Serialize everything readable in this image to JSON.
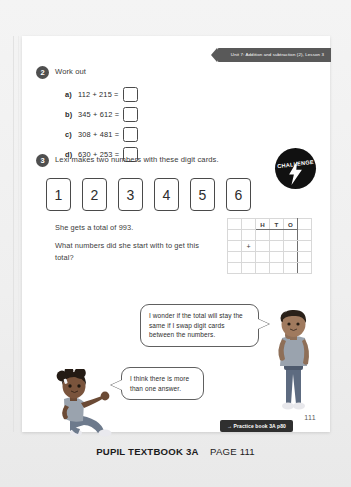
{
  "page": {
    "unit_tab": "Unit 7: Addition and subtraction (2), Lesson 3",
    "page_number": "111"
  },
  "question2": {
    "number": "2",
    "prompt": "Work out",
    "parts": [
      {
        "label": "a)",
        "expression": "112 + 215 ="
      },
      {
        "label": "b)",
        "expression": "345 + 612 ="
      },
      {
        "label": "c)",
        "expression": "308 + 481 ="
      },
      {
        "label": "d)",
        "expression": "630 + 253 ="
      }
    ]
  },
  "question3": {
    "number": "3",
    "prompt": "Lexi makes two numbers with these digit cards.",
    "challenge_label": "CHALLENGE",
    "digit_cards": [
      "1",
      "2",
      "3",
      "4",
      "5",
      "6"
    ],
    "total_statement": "She gets a total of 993.",
    "question_statement": "What numbers did she start with to get this total?",
    "hto_headers": [
      "H",
      "T",
      "O"
    ],
    "operator": "+"
  },
  "speech": {
    "boy": "I wonder if the total will stay the same if I swap digit cards between the numbers.",
    "girl": "I think there is more than one answer."
  },
  "footer": {
    "practice_tag": "→ Practice book 3A p80",
    "banner_strong": "PUPIL TEXTBOOK 3A",
    "banner_page": "PAGE 111"
  },
  "colors": {
    "tab_bg": "#595959",
    "badge_bg": "#111111",
    "ink": "#2b2b2b",
    "page_bg": "#ffffff"
  }
}
